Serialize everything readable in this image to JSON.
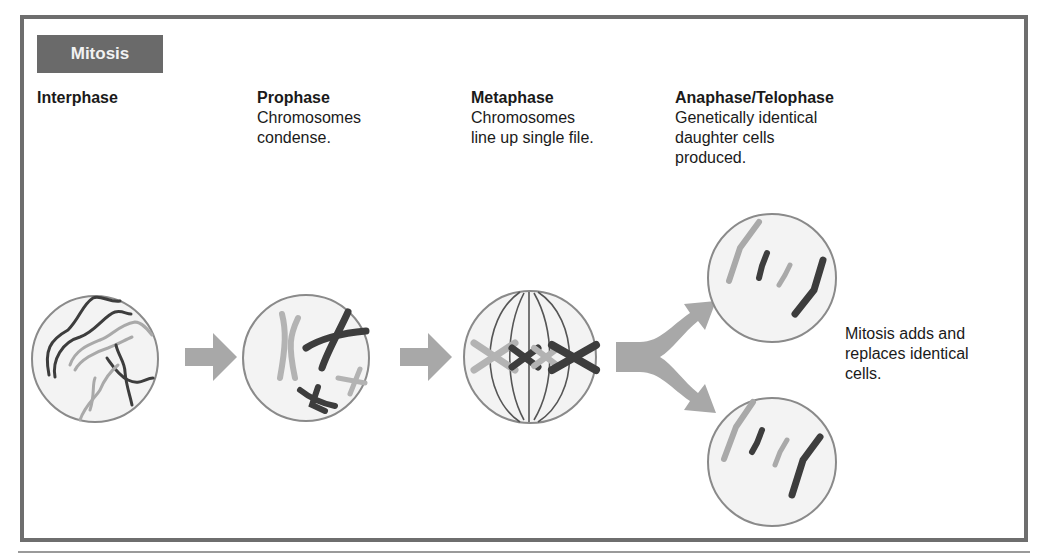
{
  "figure": {
    "title": "Mitosis",
    "stages": [
      {
        "id": "interphase",
        "heading": "Interphase",
        "description": ""
      },
      {
        "id": "prophase",
        "heading": "Prophase",
        "description": "Chromosomes\ncondense."
      },
      {
        "id": "metaphase",
        "heading": "Metaphase",
        "description": "Chromosomes\nline up single file."
      },
      {
        "id": "anaphase-telophase",
        "heading": "Anaphase/Telophase",
        "description": "Genetically identical\ndaughter cells\nproduced."
      }
    ],
    "note": "Mitosis adds and\nreplaces identical\ncells.",
    "arrows": [
      "interphase-to-prophase",
      "prophase-to-metaphase",
      "metaphase-to-daughter-cells-split"
    ],
    "colors": {
      "frame_border": "#6e6e6e",
      "title_badge_bg": "#6a6a6a",
      "title_badge_text": "#f2f2f2",
      "cell_fill": "#f3f3f3",
      "cell_border": "#8a8a8a",
      "arrow": "#a8a8a8",
      "chromosome_dark": "#3d3d3d",
      "chromosome_light": "#a9a9a9",
      "spindle": "#555555"
    }
  }
}
